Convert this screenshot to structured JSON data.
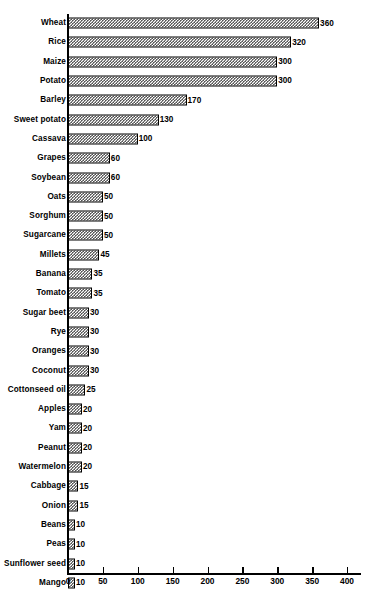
{
  "chart_data": {
    "type": "bar",
    "orientation": "horizontal",
    "title": "",
    "subtitle": "",
    "xlabel": "",
    "ylabel": "",
    "xlim": [
      0,
      400
    ],
    "xticks": [
      0,
      50,
      100,
      150,
      200,
      250,
      300,
      350,
      400
    ],
    "grid": false,
    "legend": null,
    "show_value_labels": true,
    "bar_fill": "checkered-hatch",
    "bar_edge_color": "#000000",
    "background_color": "#ffffff",
    "categories": [
      "Wheat",
      "Rice",
      "Maize",
      "Potato",
      "Barley",
      "Sweet potato",
      "Cassava",
      "Grapes",
      "Soybean",
      "Oats",
      "Sorghum",
      "Sugarcane",
      "Millets",
      "Banana",
      "Tomato",
      "Sugar beet",
      "Rye",
      "Oranges",
      "Coconut",
      "Cottonseed oil",
      "Apples",
      "Yam",
      "Peanut",
      "Watermelon",
      "Cabbage",
      "Onion",
      "Beans",
      "Peas",
      "Sunflower seed",
      "Mango"
    ],
    "values": [
      360,
      320,
      300,
      300,
      170,
      130,
      100,
      60,
      60,
      50,
      50,
      50,
      45,
      35,
      35,
      30,
      30,
      30,
      30,
      25,
      20,
      20,
      20,
      20,
      15,
      15,
      10,
      10,
      10,
      10
    ],
    "value_labels": [
      "360",
      "320",
      "300",
      "300",
      "170",
      "130",
      "100",
      "60",
      "60",
      "50",
      "50",
      "50",
      "45",
      "35",
      "35",
      "30",
      "30",
      "30",
      "30",
      "25",
      "20",
      "20",
      "20",
      "20",
      "15",
      "15",
      "10",
      "10",
      "10",
      "10"
    ],
    "xtick_labels": [
      "0",
      "50",
      "100",
      "150",
      "200",
      "250",
      "300",
      "350",
      "400"
    ]
  }
}
